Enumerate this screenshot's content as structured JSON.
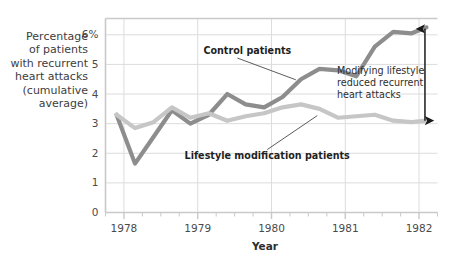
{
  "chart_data": {
    "type": "line",
    "title": "",
    "xlabel": "Year",
    "ylabel": "Percentage of patients with recurrent heart attacks (cumulative average)",
    "ylabel_lines": [
      "Percentage",
      "of patients",
      "with recurrent",
      "heart attacks",
      "(cumulative",
      "average)"
    ],
    "xlim": [
      1977.75,
      1982.25
    ],
    "ylim": [
      0,
      6.55
    ],
    "grid": true,
    "legend_position": "inline-annotations",
    "y_ticks": [
      0,
      1,
      2,
      3,
      4,
      5,
      6
    ],
    "y_tick_labels": [
      "0",
      "1",
      "2",
      "3",
      "4",
      "5",
      "6%"
    ],
    "x_ticks": [
      1978,
      1979,
      1980,
      1981,
      1982
    ],
    "x_tick_labels": [
      "1978",
      "1979",
      "1980",
      "1981",
      "1982"
    ],
    "x_minor_tick_step": 0.25,
    "x": [
      1977.9,
      1978.15,
      1978.4,
      1978.65,
      1978.9,
      1979.15,
      1979.4,
      1979.65,
      1979.9,
      1980.15,
      1980.4,
      1980.65,
      1980.9,
      1981.15,
      1981.4,
      1981.65,
      1981.9,
      1982.1
    ],
    "series": [
      {
        "name": "Control patients",
        "color": "#8d8d8d",
        "values": [
          3.3,
          1.65,
          2.55,
          3.45,
          3.0,
          3.3,
          4.0,
          3.65,
          3.55,
          3.9,
          4.5,
          4.85,
          4.8,
          4.6,
          5.6,
          6.1,
          6.05,
          6.25
        ]
      },
      {
        "name": "Lifestyle modification patients",
        "color": "#c6c6c6",
        "values": [
          3.3,
          2.85,
          3.05,
          3.55,
          3.2,
          3.35,
          3.1,
          3.25,
          3.35,
          3.55,
          3.65,
          3.5,
          3.2,
          3.25,
          3.3,
          3.1,
          3.05,
          3.1
        ]
      }
    ],
    "annotations": [
      {
        "name": "control-patients-label",
        "text": "Control patients",
        "lines": [
          "Control patients"
        ],
        "leader_from": [
          1979.05,
          5.35
        ],
        "leader_to": [
          1980.33,
          4.48
        ]
      },
      {
        "name": "lifestyle-patients-label",
        "text": "Lifestyle modification patients",
        "lines": [
          "Lifestyle modification patients"
        ],
        "leader_from": [
          1980.05,
          1.82
        ],
        "leader_to": [
          1980.62,
          3.27
        ]
      },
      {
        "name": "difference-callout",
        "lines": [
          "Modifying lifestyle",
          "reduced recurrent",
          "heart attacks"
        ],
        "text": "Modifying lifestyle reduced recurrent heart attacks",
        "arrow_x": 1982.08,
        "arrow_top": 6.2,
        "arrow_bottom": 3.1
      }
    ],
    "colors": {
      "control": "#8d8d8d",
      "lifestyle": "#c6c6c6",
      "grid": "#dcdcdc",
      "frame": "#c9c9c9",
      "text": "#3a3a3a",
      "arrow": "#1a1a1a",
      "background": "#ffffff"
    }
  }
}
